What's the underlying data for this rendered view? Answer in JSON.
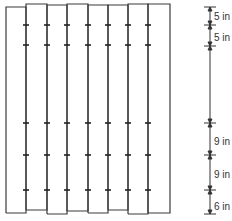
{
  "diagram": {
    "type": "board-fence-nailing-schedule",
    "line_color": "#3a3a3a",
    "boards": {
      "count": 8,
      "x_edges": [
        6,
        26,
        47,
        67,
        88,
        108,
        128,
        148,
        170
      ],
      "top_y": [
        7,
        4,
        5,
        4,
        5,
        5,
        4,
        4
      ],
      "bottom_y": [
        213,
        210,
        214,
        211,
        213,
        210,
        214,
        213
      ]
    },
    "nail_rows_y": [
      25,
      45,
      123,
      155,
      190
    ],
    "dimension_line": {
      "x": 210,
      "ticks_y": [
        7,
        25,
        46,
        123,
        155,
        190,
        214
      ],
      "labels": [
        {
          "text": "5 in",
          "y": 17
        },
        {
          "text": "5 in",
          "y": 38
        },
        {
          "text": "9 in",
          "y": 142
        },
        {
          "text": "9 in",
          "y": 175
        },
        {
          "text": "6 in",
          "y": 207
        }
      ]
    }
  }
}
